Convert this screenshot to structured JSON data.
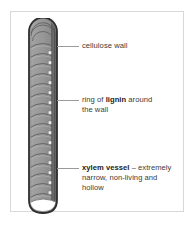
{
  "figure": {
    "title_alt": "xylem vessel diagram",
    "frame_color": "#d8d8d8",
    "background_color": "#ffffff"
  },
  "diagram": {
    "name": "xylem-vessel",
    "orientation": "vertical",
    "cap_shape": "rounded-dome-top",
    "bottom_shape": "open-curved",
    "wall_color": "#8e8e8e",
    "wall_outline_color": "#3a3a3a",
    "ring_color": "#6f6f6f",
    "pit_color": "#efefef",
    "ring_count": 17,
    "pit_count": 15
  },
  "labels": [
    {
      "id": "cellulose-wall",
      "lead_y": 46,
      "text_plain": "cellulose wall",
      "parts": [
        {
          "text": "cellulose wall",
          "bold": false
        }
      ]
    },
    {
      "id": "ring-of-lignin",
      "lead_y": 100,
      "text_plain": "ring of lignin around the wall",
      "parts": [
        {
          "text": "ring of ",
          "bold": false
        },
        {
          "text": "lignin",
          "bold": true
        },
        {
          "text": " around\nthe wall",
          "bold": false
        }
      ]
    },
    {
      "id": "xylem-vessel",
      "lead_y": 168,
      "text_plain": "xylem vessel – extremely narrow, non-living and hollow",
      "parts": [
        {
          "text": "xylem vessel",
          "bold": true
        },
        {
          "text": " – extremely\nnarrow, non-living and\nhollow",
          "bold": false
        }
      ]
    }
  ],
  "text": {
    "cellulose_wall": "cellulose wall",
    "lignin_prefix": "ring of ",
    "lignin_bold": "lignin",
    "lignin_suffix": " around\nthe wall",
    "xylem_bold": "xylem vessel",
    "xylem_suffix": " – extremely\nnarrow, non-living and\nhollow"
  }
}
